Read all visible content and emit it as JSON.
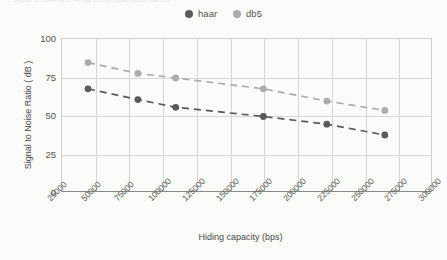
{
  "caption": {
    "text": "Signal to noise ratio versus hiding capacity comparison"
  },
  "legend": {
    "position": "top-center",
    "items": [
      {
        "label": "haar",
        "color": "#5a5a5a",
        "icon": "legend-dot-icon"
      },
      {
        "label": "db5",
        "color": "#acacac",
        "icon": "legend-dot-icon"
      }
    ]
  },
  "chart_data": {
    "type": "scatter",
    "title": "",
    "xlabel": "Hiding capacity (bps)",
    "ylabel": "Signal to Noise Ratio ( dB )",
    "xlim": [
      25000,
      300000
    ],
    "ylim": [
      0,
      100
    ],
    "xticks": [
      25000,
      50000,
      75000,
      100000,
      125000,
      150000,
      175000,
      200000,
      225000,
      250000,
      275000,
      300000
    ],
    "xtick_labels": [
      "25000",
      "50000",
      "75000",
      "100000",
      "125000",
      "150000",
      "175000",
      "200000",
      "225000",
      "250000",
      "275000",
      "300000"
    ],
    "yticks": [
      0,
      25,
      50,
      75,
      100
    ],
    "ytick_labels": [
      "0",
      "25",
      "50",
      "75",
      "100"
    ],
    "grid": true,
    "line_style": "dashed",
    "marker": "circle",
    "series": [
      {
        "name": "haar",
        "color": "#5a5a5a",
        "x": [
          45000,
          82000,
          110000,
          175000,
          222000,
          265000
        ],
        "values": [
          67,
          60,
          55,
          49,
          44,
          37
        ]
      },
      {
        "name": "db5",
        "color": "#acacac",
        "x": [
          45000,
          82000,
          110000,
          175000,
          222000,
          265000
        ],
        "values": [
          84,
          77,
          74,
          67,
          59,
          53
        ]
      }
    ]
  }
}
